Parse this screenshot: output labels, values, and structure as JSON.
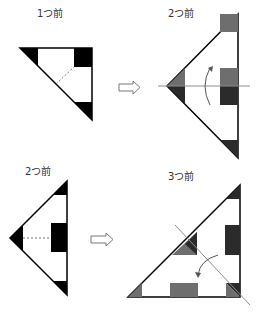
{
  "panels": [
    {
      "label": "1つ前",
      "stage": 1
    },
    {
      "label": "2つ前",
      "stage": 2
    },
    {
      "label": "2つ前",
      "stage": 2
    },
    {
      "label": "3つ前",
      "stage": 3
    }
  ],
  "arrows": [
    {
      "icon": "outline-right-arrow-icon"
    },
    {
      "icon": "outline-right-arrow-icon"
    }
  ],
  "colors": {
    "black": "#000000",
    "dark": "#2b2b2b",
    "gray": "#6e6e6e",
    "line": "#8c8c8c"
  }
}
